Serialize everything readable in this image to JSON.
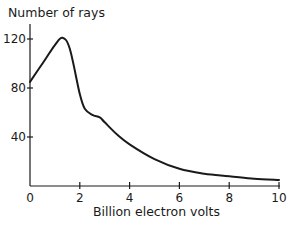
{
  "chart_data": {
    "type": "line",
    "title": "",
    "xlabel": "Billion electron volts",
    "ylabel": "Number of rays",
    "xlim": [
      0,
      10
    ],
    "ylim": [
      0,
      130
    ],
    "xticks": [
      0,
      2,
      4,
      6,
      8,
      10
    ],
    "yticks": [
      40,
      80,
      120
    ],
    "xtick_labels": [
      "0",
      "2",
      "4",
      "6",
      "8",
      "10"
    ],
    "ytick_labels": [
      "40",
      "80",
      "120"
    ],
    "grid": false,
    "legend": null,
    "series": [
      {
        "name": "Number of rays",
        "color": "#1a1a1a",
        "x": [
          0,
          0.5,
          1.0,
          1.3,
          1.6,
          2.0,
          2.2,
          2.5,
          2.8,
          3.0,
          3.5,
          4.0,
          5.0,
          6.0,
          7.0,
          8.0,
          9.0,
          10.0
        ],
        "y": [
          85,
          100,
          115,
          121,
          112,
          75,
          63,
          58,
          56,
          52,
          42,
          34,
          22,
          14,
          10,
          8,
          6,
          5
        ]
      }
    ]
  }
}
